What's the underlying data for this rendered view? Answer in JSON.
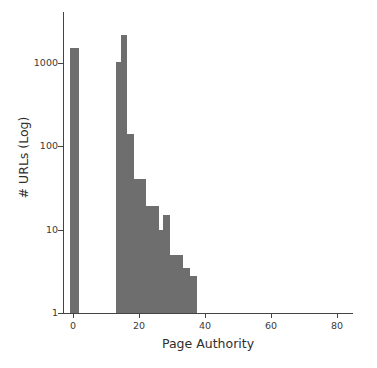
{
  "chart_data": {
    "type": "bar",
    "title": "",
    "xlabel": "Page Authority",
    "ylabel": "# URLs (Log)",
    "yscale": "log",
    "xlim": [
      -3,
      85
    ],
    "ylim": [
      1,
      2600
    ],
    "grid": false,
    "legend": null,
    "bar_color": "#6e6e6e",
    "xticks": [
      0,
      20,
      40,
      60,
      80
    ],
    "xtick_labels": [
      "0",
      "20",
      "40",
      "60",
      "80"
    ],
    "yticks": [
      1,
      10,
      100,
      1000
    ],
    "ytick_labels": [
      "1",
      "10",
      "100",
      "1000"
    ],
    "bin_width": 2.0,
    "bars": [
      {
        "label": "0",
        "x0": -0.8,
        "x1": 1.9,
        "value": 1480
      },
      {
        "label": "13",
        "x0": 13.0,
        "x1": 14.5,
        "value": 1005
      },
      {
        "label": "14",
        "x0": 14.5,
        "x1": 16.5,
        "value": 2150
      },
      {
        "label": "16",
        "x0": 16.5,
        "x1": 18.4,
        "value": 140
      },
      {
        "label": "18",
        "x0": 18.4,
        "x1": 20.3,
        "value": 40
      },
      {
        "label": "20",
        "x0": 20.3,
        "x1": 22.3,
        "value": 40
      },
      {
        "label": "22",
        "x0": 22.3,
        "x1": 24.2,
        "value": 19
      },
      {
        "label": "24",
        "x0": 24.2,
        "x1": 26.1,
        "value": 19
      },
      {
        "label": "26",
        "x0": 26.1,
        "x1": 27.4,
        "value": 10
      },
      {
        "label": "27",
        "x0": 27.4,
        "x1": 29.4,
        "value": 15
      },
      {
        "label": "29",
        "x0": 29.4,
        "x1": 31.5,
        "value": 5
      },
      {
        "label": "31",
        "x0": 31.5,
        "x1": 33.5,
        "value": 5
      },
      {
        "label": "33",
        "x0": 33.5,
        "x1": 35.5,
        "value": 3.5
      },
      {
        "label": "35",
        "x0": 35.5,
        "x1": 37.6,
        "value": 2.8
      }
    ]
  }
}
